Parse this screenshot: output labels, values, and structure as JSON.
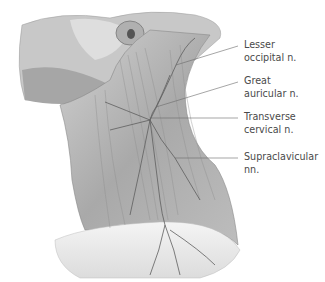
{
  "figure": {
    "colors": {
      "illustration": "#8a8a8a",
      "leader_line": "#6a6a6a",
      "text": "#4a4a4a"
    }
  },
  "labels": [
    {
      "line1": "Lesser",
      "line2": "occipital n."
    },
    {
      "line1": "Great",
      "line2": "auricular n."
    },
    {
      "line1": "Transverse",
      "line2": "cervical n."
    },
    {
      "line1": "Supraclavicular",
      "line2": "nn."
    }
  ]
}
